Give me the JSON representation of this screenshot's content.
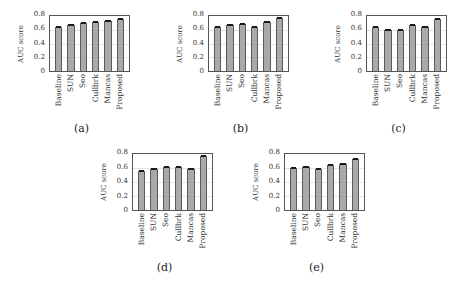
{
  "figure": {
    "y_axis_label": "AUC score",
    "y_ticks": [
      "0",
      "0.2",
      "0.4",
      "0.6",
      "0.8"
    ],
    "categories": [
      "Baseline",
      "SUN",
      "Seo",
      "Cullbrk",
      "Mancas",
      "Proposed"
    ],
    "bar_color": "#a9a9a9",
    "edge_color": "#5a5a5a"
  },
  "chart_data": [
    {
      "type": "bar",
      "title": "(a)",
      "categories": [
        "Baseline",
        "SUN",
        "Seo",
        "Cullbrk",
        "Mancas",
        "Proposed"
      ],
      "values": [
        0.64,
        0.67,
        0.7,
        0.72,
        0.73,
        0.75
      ],
      "xlabel": "",
      "ylabel": "AUC score",
      "ylim": [
        0,
        0.8
      ],
      "grid": true,
      "error_bars": true
    },
    {
      "type": "bar",
      "title": "(b)",
      "categories": [
        "Baseline",
        "SUN",
        "Seo",
        "Cullbrk",
        "Mancas",
        "Proposed"
      ],
      "values": [
        0.64,
        0.67,
        0.69,
        0.64,
        0.71,
        0.77
      ],
      "xlabel": "",
      "ylabel": "AUC score",
      "ylim": [
        0,
        0.8
      ],
      "grid": true,
      "error_bars": true
    },
    {
      "type": "bar",
      "title": "(c)",
      "categories": [
        "Baseline",
        "SUN",
        "Seo",
        "Cullbrk",
        "Mancas",
        "Proposed"
      ],
      "values": [
        0.64,
        0.59,
        0.6,
        0.67,
        0.64,
        0.75
      ],
      "xlabel": "",
      "ylabel": "AUC score",
      "ylim": [
        0,
        0.8
      ],
      "grid": true,
      "error_bars": true
    },
    {
      "type": "bar",
      "title": "(d)",
      "categories": [
        "Baseline",
        "SUN",
        "Seo",
        "Cullbrk",
        "Mancas",
        "Proposed"
      ],
      "values": [
        0.56,
        0.58,
        0.62,
        0.62,
        0.59,
        0.77
      ],
      "xlabel": "",
      "ylabel": "AUC score",
      "ylim": [
        0,
        0.8
      ],
      "grid": true,
      "error_bars": true
    },
    {
      "type": "bar",
      "title": "(e)",
      "categories": [
        "Baseline",
        "SUN",
        "Seo",
        "Cullbrk",
        "Mancas",
        "Proposed"
      ],
      "values": [
        0.6,
        0.61,
        0.59,
        0.64,
        0.66,
        0.73
      ],
      "xlabel": "",
      "ylabel": "AUC score",
      "ylim": [
        0,
        0.8
      ],
      "grid": true,
      "error_bars": true
    }
  ],
  "panels": [
    {
      "caption": "(a)",
      "frame": {
        "x": 49,
        "y": 15,
        "w": 81,
        "h": 57
      }
    },
    {
      "caption": "(b)",
      "frame": {
        "x": 208,
        "y": 15,
        "w": 81,
        "h": 57
      }
    },
    {
      "caption": "(c)",
      "frame": {
        "x": 366,
        "y": 15,
        "w": 81,
        "h": 57
      }
    },
    {
      "caption": "(d)",
      "frame": {
        "x": 132,
        "y": 153,
        "w": 81,
        "h": 58
      }
    },
    {
      "caption": "(e)",
      "frame": {
        "x": 284,
        "y": 153,
        "w": 81,
        "h": 58
      }
    }
  ]
}
